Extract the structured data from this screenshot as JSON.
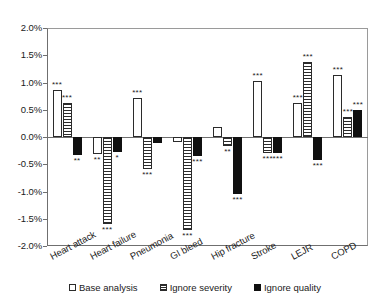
{
  "chart_data": {
    "type": "bar",
    "title": "",
    "subtitle": "",
    "xlabel": "",
    "ylabel": "",
    "ylim": [
      -2.0,
      2.0
    ],
    "ytick_step": 0.5,
    "ytick_labels": [
      "2.0%",
      "1.5%",
      "1.0%",
      "0.5%",
      "0.0%",
      "-0.5%",
      "-1.0%",
      "-1.5%",
      "-2.0%"
    ],
    "ytick_values": [
      2.0,
      1.5,
      1.0,
      0.5,
      0.0,
      -0.5,
      -1.0,
      -1.5,
      -2.0
    ],
    "grid": false,
    "legend_position": "bottom",
    "value_unit": "percent",
    "categories": [
      "Heart attack",
      "Heart failure",
      "Pneumonia",
      "GI bleed",
      "Hip fracture",
      "Stroke",
      "LEJR",
      "COPD"
    ],
    "series": [
      {
        "name": "Base analysis",
        "fill": "white",
        "values": [
          0.87,
          -0.32,
          0.72,
          -0.1,
          0.18,
          1.03,
          0.63,
          1.13
        ],
        "significance": [
          "***",
          "**",
          "***",
          "",
          "",
          "***",
          "***",
          "***"
        ]
      },
      {
        "name": "Ignore severity",
        "fill": "hatched",
        "values": [
          0.62,
          -1.6,
          -0.58,
          -1.7,
          -0.17,
          -0.3,
          1.37,
          0.37
        ],
        "significance": [
          "***",
          "***",
          "***",
          "***",
          "**",
          "***",
          "***",
          "***"
        ]
      },
      {
        "name": "Ignore quality",
        "fill": "black",
        "values": [
          -0.33,
          -0.28,
          -0.11,
          -0.35,
          -1.05,
          -0.3,
          -0.42,
          0.5
        ],
        "significance": [
          "**",
          "*",
          "",
          "***",
          "***",
          "***",
          "***",
          "***"
        ]
      }
    ]
  },
  "legend": {
    "items": [
      {
        "label": "Base analysis",
        "key": "base"
      },
      {
        "label": "Ignore severity",
        "key": "severity"
      },
      {
        "label": "Ignore quality",
        "key": "quality"
      }
    ]
  },
  "colors": {
    "axis": "#6f6f6f",
    "bar_outline": "#2b2b2b",
    "bar_solid": "#101010",
    "background": "#ffffff",
    "text": "#1a1a1a"
  }
}
